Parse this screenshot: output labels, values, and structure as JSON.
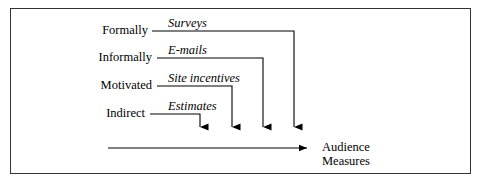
{
  "figure": {
    "type": "flow-diagram",
    "background_color": "#ffffff",
    "border_color": "#333333",
    "line_color": "#000000"
  },
  "rows": [
    {
      "source": "Formally",
      "method": "Surveys",
      "source_x": 148,
      "source_y": 31,
      "method_x": 168,
      "method_y": 24,
      "line_start_x": 152,
      "line_y": 31,
      "turn_x": 294,
      "arrow_tip_y": 136
    },
    {
      "source": "Informally",
      "method": "E-mails",
      "source_x": 152,
      "source_y": 58,
      "method_x": 168,
      "method_y": 51,
      "line_start_x": 157,
      "line_y": 58,
      "turn_x": 263,
      "arrow_tip_y": 136
    },
    {
      "source": "Motivated",
      "method": "Site incentives",
      "source_x": 152,
      "source_y": 86,
      "method_x": 168,
      "method_y": 79,
      "line_start_x": 157,
      "line_y": 86,
      "turn_x": 232,
      "arrow_tip_y": 136
    },
    {
      "source": "Indirect",
      "method": "Estimates",
      "source_x": 145,
      "source_y": 114,
      "method_x": 168,
      "method_y": 107,
      "line_start_x": 150,
      "line_y": 114,
      "turn_x": 200,
      "arrow_tip_y": 136
    }
  ],
  "baseline": {
    "start_x": 108,
    "end_x": 316,
    "y": 148
  },
  "outcome": {
    "line1": "Audience",
    "line2": "Measures",
    "x": 322,
    "y": 141
  }
}
